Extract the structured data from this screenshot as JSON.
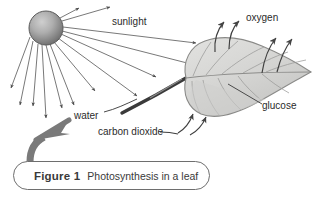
{
  "figure": {
    "caption_number": "Figure 1",
    "caption_title": "Photosynthesis in a leaf",
    "alt": "Diagram of photosynthesis in a leaf showing sunlight, water, carbon dioxide inputs and oxygen, glucose outputs"
  },
  "labels": {
    "sunlight": "sunlight",
    "oxygen": "oxygen",
    "glucose": "glucose",
    "water": "water",
    "carbon_dioxide": "carbon dioxide"
  },
  "colors": {
    "ink": "#2b2b2b",
    "line": "#555555",
    "sun_light": "#c9c9c9",
    "sun_dark": "#6f6f6f",
    "leaf_fill": "#d8d8d6",
    "leaf_outline": "#8a8a88",
    "leaf_vein": "#9a9a98",
    "big_arrow": "#7a7a7a",
    "caption_border": "#6e6e6e",
    "background": "#ffffff"
  },
  "diagram": {
    "type": "labelled-illustration",
    "subject": "photosynthesis",
    "inputs": [
      "sunlight",
      "water",
      "carbon dioxide"
    ],
    "outputs": [
      "oxygen",
      "glucose"
    ],
    "sun": {
      "cx": 46,
      "cy": 28,
      "r": 17,
      "ray_count": 13
    },
    "leaf": {
      "cx": 222,
      "cy": 72
    },
    "oxygen_arrow_count": 4,
    "carbon_dioxide_arrow_count": 2
  }
}
